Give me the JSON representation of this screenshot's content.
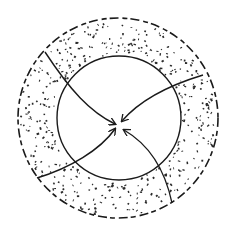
{
  "diagram": {
    "colors": {
      "ink": "#1a1a1a",
      "background": "#ffffff",
      "stipple": "#2a2a2a"
    },
    "outer_circle": {
      "cx": 118,
      "cy": 118,
      "r": 100,
      "style": "dashed"
    },
    "inner_circle": {
      "cx": 119,
      "cy": 118,
      "r": 62,
      "style": "solid"
    },
    "center_point": {
      "x": 118,
      "y": 126
    },
    "arrows": [
      {
        "id": "from-upper-left",
        "start": [
          45,
          52
        ]
      },
      {
        "id": "from-upper-right",
        "start": [
          203,
          75
        ]
      },
      {
        "id": "from-lower-left",
        "start": [
          37,
          178
        ]
      },
      {
        "id": "from-lower-right",
        "start": [
          172,
          203
        ]
      }
    ],
    "labels": []
  }
}
